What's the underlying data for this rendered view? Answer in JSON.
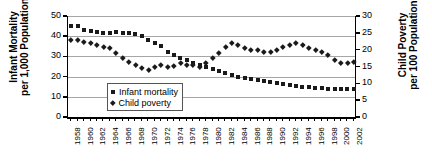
{
  "chart_data": {
    "type": "scatter",
    "title": "",
    "xlabel": "",
    "x": [
      1958,
      1959,
      1960,
      1961,
      1962,
      1963,
      1964,
      1965,
      1966,
      1967,
      1968,
      1969,
      1970,
      1971,
      1972,
      1973,
      1974,
      1975,
      1976,
      1977,
      1978,
      1979,
      1980,
      1981,
      1982,
      1983,
      1984,
      1985,
      1986,
      1987,
      1988,
      1989,
      1990,
      1991,
      1992,
      1993,
      1994,
      1995,
      1996,
      1997,
      1998,
      1999,
      2000,
      2001,
      2002
    ],
    "xtick_labels": [
      "1958",
      "1960",
      "1962",
      "1964",
      "1966",
      "1968",
      "1970",
      "1972",
      "1974",
      "1976",
      "1978",
      "1980",
      "1982",
      "1984",
      "1986",
      "1988",
      "1990",
      "1992",
      "1994",
      "1996",
      "1998",
      "2000",
      "2002"
    ],
    "grid": true,
    "legend_position": "inside-lower-left",
    "axes": [
      {
        "id": "left",
        "label": "Infant Mortality per 1,000 Population",
        "label_line1": "Infant Mortality",
        "label_line2": "per 1,000 Population",
        "lim": [
          0,
          50
        ],
        "ticks": [
          0,
          10,
          20,
          30,
          40,
          50
        ]
      },
      {
        "id": "right",
        "label": "Child Poverty per 100 Population",
        "label_line1": "Child Poverty",
        "label_line2": "per 100 Population",
        "lim": [
          0,
          30
        ],
        "ticks": [
          0,
          5,
          10,
          15,
          20,
          25,
          30
        ]
      }
    ],
    "series": [
      {
        "name": "Infant mortality",
        "legend_label": "Infant mortality",
        "marker": "square",
        "color": "#1a1a1a",
        "axis": "left",
        "values": [
          45.3,
          45.0,
          43.0,
          42.5,
          42.0,
          41.8,
          41.5,
          42.0,
          41.5,
          41.5,
          41.0,
          40.0,
          38.0,
          36.5,
          35.0,
          32.0,
          30.5,
          29.0,
          28.0,
          27.0,
          26.0,
          25.0,
          24.0,
          23.0,
          22.0,
          21.0,
          20.0,
          19.5,
          19.0,
          18.5,
          18.0,
          17.5,
          17.0,
          16.5,
          16.0,
          15.5,
          15.0,
          14.8,
          14.5,
          14.2,
          14.0,
          14.0,
          14.0,
          14.0,
          14.0
        ]
      },
      {
        "name": "Child poverty",
        "legend_label": "Child poverty",
        "marker": "diamond",
        "color": "#1a1a1a",
        "axis": "right",
        "values": [
          23.0,
          23.0,
          22.5,
          22.0,
          21.5,
          21.0,
          20.5,
          19.0,
          17.5,
          16.5,
          15.5,
          14.5,
          14.0,
          15.0,
          15.5,
          15.0,
          15.3,
          16.0,
          15.6,
          15.5,
          15.0,
          16.0,
          17.5,
          19.0,
          21.0,
          22.0,
          21.5,
          20.5,
          20.0,
          20.0,
          19.5,
          19.5,
          20.0,
          21.0,
          21.5,
          22.0,
          21.5,
          20.5,
          20.0,
          19.5,
          18.5,
          17.0,
          16.0,
          16.0,
          16.5
        ]
      }
    ]
  },
  "legend": {
    "items": [
      {
        "label": "Infant mortality",
        "marker": "square"
      },
      {
        "label": "Child poverty",
        "marker": "diamond"
      }
    ]
  }
}
